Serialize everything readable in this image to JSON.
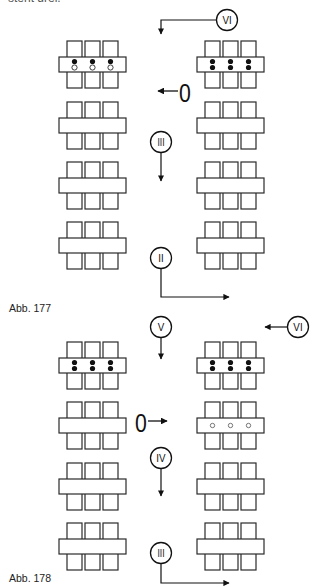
{
  "header": {
    "cut_off_text": "steht drei."
  },
  "colors": {
    "stroke": "#2a2a2a",
    "filled_dot": "#111111",
    "open_dot": "#ffffff",
    "background": "#ffffff"
  },
  "figures": [
    {
      "id": "abb-177",
      "caption": "Abb. 177",
      "table_rows_y": [
        41,
        102,
        162,
        222
      ],
      "columns_x": [
        59,
        197
      ],
      "dots": [
        {
          "row": 0,
          "col": 0,
          "pattern": "filled-top-open-bottom"
        },
        {
          "row": 0,
          "col": 1,
          "pattern": "filled-both"
        }
      ],
      "markers": [
        {
          "label": "VI",
          "cx": 227,
          "cy": 20,
          "path": "left-then-down",
          "arrow_to": [
            161,
            34
          ]
        },
        {
          "label": "0",
          "x": 179,
          "y": 83,
          "arrow_direction": "left",
          "arrow_to": [
            158,
            91
          ]
        },
        {
          "label": "III",
          "cx": 161,
          "cy": 142,
          "path": "down",
          "arrow_to": [
            161,
            181
          ]
        },
        {
          "label": "II",
          "cx": 161,
          "cy": 258,
          "path": "down-then-right",
          "arrow_to": [
            229,
            297
          ]
        }
      ]
    },
    {
      "id": "abb-178",
      "caption": "Abb. 178",
      "table_rows_y": [
        342,
        402,
        463,
        523
      ],
      "columns_x": [
        59,
        197
      ],
      "dots": [
        {
          "row": 0,
          "col": 0,
          "pattern": "filled-both"
        },
        {
          "row": 0,
          "col": 1,
          "pattern": "filled-both"
        },
        {
          "row": 1,
          "col": 1,
          "pattern": "open-center"
        }
      ],
      "markers": [
        {
          "label": "V",
          "cx": 161,
          "cy": 327,
          "path": "down",
          "arrow_to": [
            161,
            359
          ]
        },
        {
          "label": "VI",
          "cx": 298,
          "cy": 327,
          "path": "left",
          "arrow_to": [
            265,
            327
          ]
        },
        {
          "label": "0",
          "x": 135,
          "y": 413,
          "arrow_direction": "right",
          "arrow_to": [
            167,
            421
          ]
        },
        {
          "label": "IV",
          "cx": 161,
          "cy": 458,
          "path": "down",
          "arrow_to": [
            161,
            496
          ]
        },
        {
          "label": "III",
          "cx": 161,
          "cy": 553,
          "path": "down-then-right",
          "arrow_to": [
            229,
            583
          ]
        }
      ]
    }
  ]
}
